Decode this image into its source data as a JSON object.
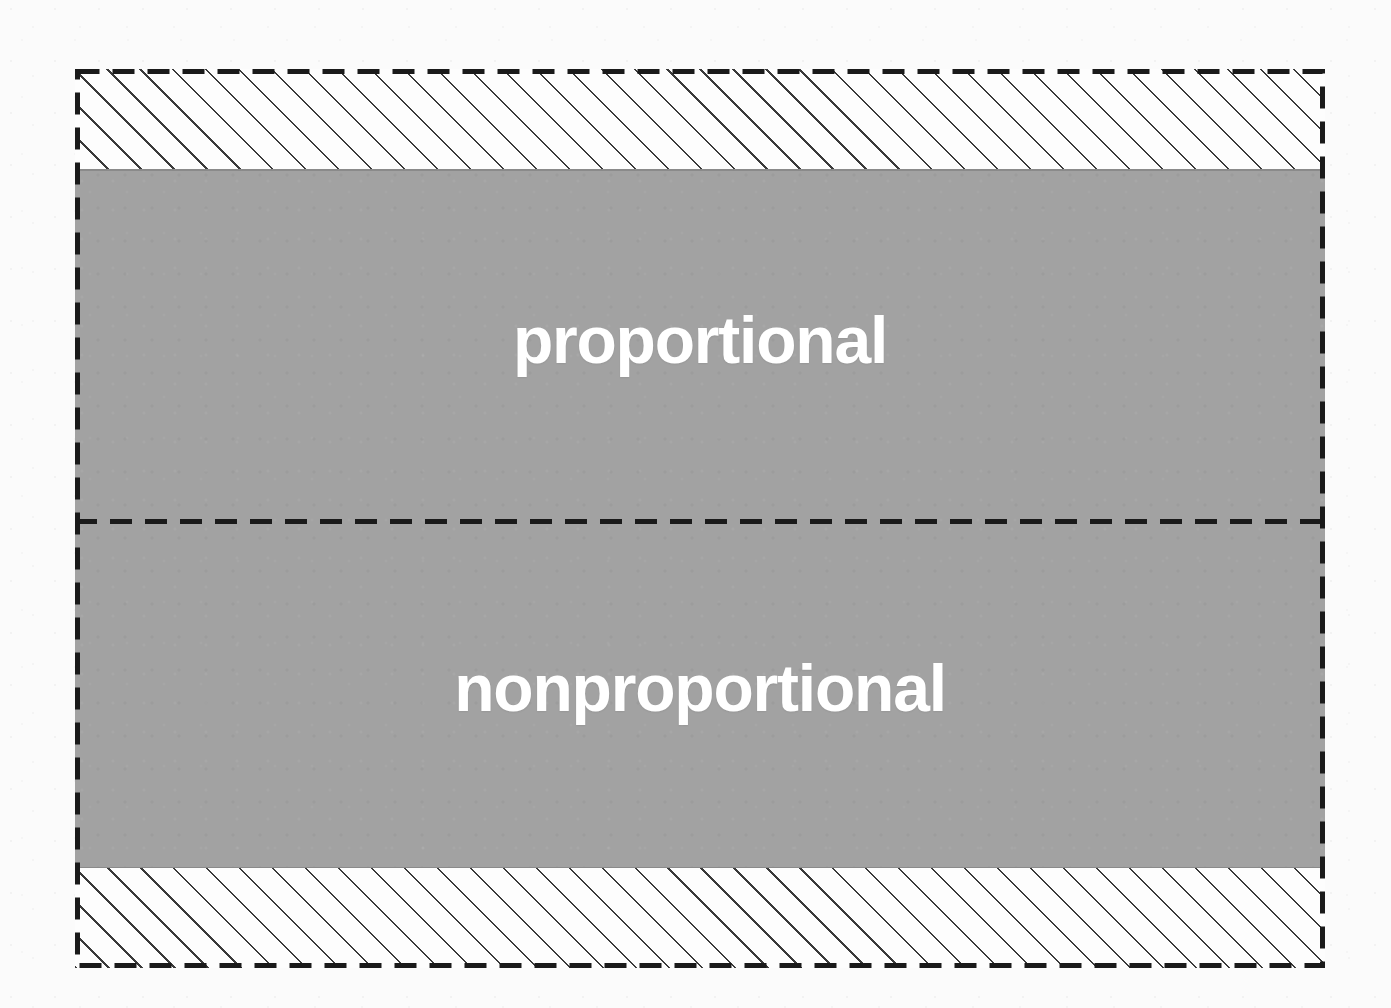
{
  "diagram": {
    "type": "band-region-diagram",
    "background_color": "#fbfbfb",
    "regions": [
      {
        "id": "hatched-top",
        "label": "",
        "fill": "hatched",
        "fill_color": "#fdfdfd",
        "hatch_color": "#3a3a3a",
        "hatch_angle_deg": 45
      },
      {
        "id": "proportional",
        "label": "proportional",
        "fill": "solid",
        "fill_color": "#a2a2a2",
        "text_color": "#ffffff"
      },
      {
        "id": "nonproportional",
        "label": "nonproportional",
        "fill": "solid",
        "fill_color": "#a2a2a2",
        "text_color": "#ffffff"
      },
      {
        "id": "hatched-bottom",
        "label": "",
        "fill": "hatched",
        "fill_color": "#fdfdfd",
        "hatch_color": "#3a3a3a",
        "hatch_angle_deg": 45
      }
    ],
    "borders": {
      "outer": {
        "style": "dashed",
        "color": "#1a1a1a",
        "width_px": 5
      },
      "divider": {
        "style": "dashed",
        "color": "#1a1a1a",
        "width_px": 5
      },
      "body_edge": {
        "style": "solid",
        "color": "#8a8a8a",
        "width_px": 2
      }
    },
    "labels": {
      "proportional": "proportional",
      "nonproportional": "nonproportional"
    }
  }
}
